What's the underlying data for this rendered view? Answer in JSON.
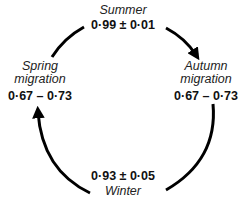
{
  "diagram": {
    "type": "cycle",
    "direction": "clockwise",
    "nodes": [
      {
        "id": "summer",
        "season": "Summer",
        "value": "0·99 ± 0·01"
      },
      {
        "id": "autumn",
        "season": "Autumn migration",
        "season_line1": "Autumn",
        "season_line2": "migration",
        "value": "0·67 – 0·73"
      },
      {
        "id": "winter",
        "season": "Winter",
        "value": "0·93 ± 0·05"
      },
      {
        "id": "spring",
        "season": "Spring migration",
        "season_line1": "Spring",
        "season_line2": "migration",
        "value": "0·67 – 0·73"
      }
    ],
    "edges": [
      {
        "from": "summer",
        "to": "autumn",
        "arrow": true
      },
      {
        "from": "autumn",
        "to": "winter",
        "arrow": false
      },
      {
        "from": "winter",
        "to": "spring",
        "arrow": true
      },
      {
        "from": "spring",
        "to": "summer",
        "arrow": false
      }
    ],
    "colors": {
      "line": "#000000",
      "background": "#ffffff"
    }
  }
}
